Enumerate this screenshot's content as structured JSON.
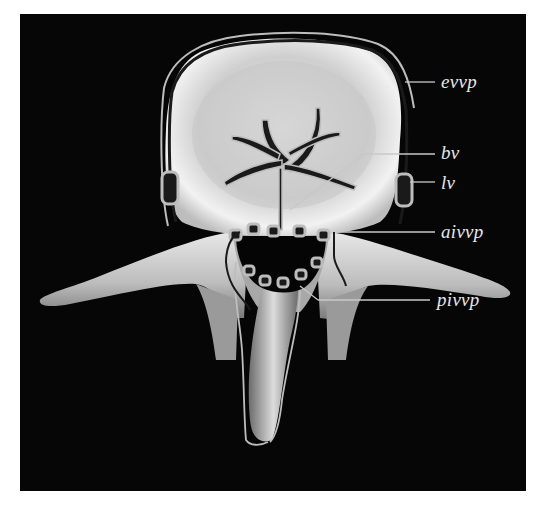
{
  "figure": {
    "background": "#060606",
    "bone_color": "#d8d8d8",
    "vessel_outline_color": "#bdbdbd",
    "vessel_fill_color": "#1a1a1a",
    "leader_color": "#c8c8c8"
  },
  "labels": [
    {
      "id": "evvp",
      "text": "evvp"
    },
    {
      "id": "bv",
      "text": "bv"
    },
    {
      "id": "lv",
      "text": "lv"
    },
    {
      "id": "aivvp",
      "text": "aivvp"
    },
    {
      "id": "pivvp",
      "text": "pivvp"
    }
  ]
}
